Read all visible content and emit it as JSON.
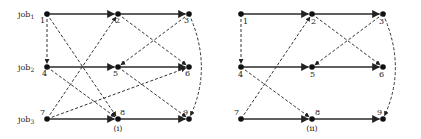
{
  "job_labels": [
    {
      "base": "job",
      "sub": "1",
      "y": 17
    },
    {
      "base": "job",
      "sub": "2",
      "y": 70
    },
    {
      "base": "job",
      "sub": "3",
      "y": 122
    }
  ],
  "diagrams": [
    {
      "caption": "(i)",
      "caption_pos": [
        118,
        131
      ],
      "nodes": [
        {
          "id": "1",
          "x": 47,
          "y": 14,
          "lx": -7,
          "ly": 9
        },
        {
          "id": "2",
          "x": 118,
          "y": 14,
          "lx": -3,
          "ly": 9
        },
        {
          "id": "3",
          "x": 189,
          "y": 14,
          "lx": -5,
          "ly": 9
        },
        {
          "id": "4",
          "x": 47,
          "y": 67,
          "lx": -5,
          "ly": 9
        },
        {
          "id": "5",
          "x": 118,
          "y": 67,
          "lx": -5,
          "ly": 9
        },
        {
          "id": "6",
          "x": 189,
          "y": 67,
          "lx": -4,
          "ly": 9
        },
        {
          "id": "7",
          "x": 47,
          "y": 119,
          "lx": -7,
          "ly": -4
        },
        {
          "id": "8",
          "x": 118,
          "y": 119,
          "lx": 2,
          "ly": -4
        },
        {
          "id": "9",
          "x": 189,
          "y": 119,
          "lx": -6,
          "ly": -4
        }
      ],
      "solid_edges": [
        [
          "1",
          "2"
        ],
        [
          "2",
          "3"
        ],
        [
          "4",
          "5"
        ],
        [
          "5",
          "6"
        ],
        [
          "7",
          "8"
        ],
        [
          "8",
          "9"
        ]
      ],
      "dashed_edges": [
        [
          "1",
          "4"
        ],
        [
          "1",
          "8"
        ],
        [
          "2",
          "6"
        ],
        [
          "3",
          "5"
        ],
        [
          "4",
          "8"
        ],
        [
          "7",
          "2"
        ],
        [
          "7",
          "6"
        ],
        [
          "5",
          "9"
        ]
      ],
      "arcs": [
        {
          "from": "3",
          "to": "9",
          "ctrl": [
            213,
            67
          ]
        }
      ]
    },
    {
      "caption": "(ii)",
      "caption_pos": [
        312,
        131
      ],
      "nodes": [
        {
          "id": "1",
          "x": 241,
          "y": 14,
          "lx": 2,
          "ly": 10
        },
        {
          "id": "2",
          "x": 312,
          "y": 14,
          "lx": -1,
          "ly": 10
        },
        {
          "id": "3",
          "x": 383,
          "y": 14,
          "lx": -4,
          "ly": 10
        },
        {
          "id": "4",
          "x": 241,
          "y": 67,
          "lx": -3,
          "ly": 10
        },
        {
          "id": "5",
          "x": 312,
          "y": 67,
          "lx": -2,
          "ly": 10
        },
        {
          "id": "6",
          "x": 383,
          "y": 67,
          "lx": -4,
          "ly": 10
        },
        {
          "id": "7",
          "x": 241,
          "y": 119,
          "lx": -7,
          "ly": -4
        },
        {
          "id": "8",
          "x": 312,
          "y": 119,
          "lx": 3,
          "ly": -4
        },
        {
          "id": "9",
          "x": 383,
          "y": 119,
          "lx": -6,
          "ly": -4
        }
      ],
      "solid_edges": [
        [
          "1",
          "2"
        ],
        [
          "2",
          "3"
        ],
        [
          "4",
          "5"
        ],
        [
          "5",
          "6"
        ],
        [
          "7",
          "8"
        ],
        [
          "8",
          "9"
        ]
      ],
      "dashed_edges": [
        [
          "1",
          "4"
        ],
        [
          "2",
          "6"
        ],
        [
          "3",
          "5"
        ],
        [
          "4",
          "8"
        ],
        [
          "7",
          "2"
        ]
      ],
      "arcs": [
        {
          "from": "3",
          "to": "9",
          "ctrl": [
            407,
            67
          ]
        }
      ]
    }
  ]
}
